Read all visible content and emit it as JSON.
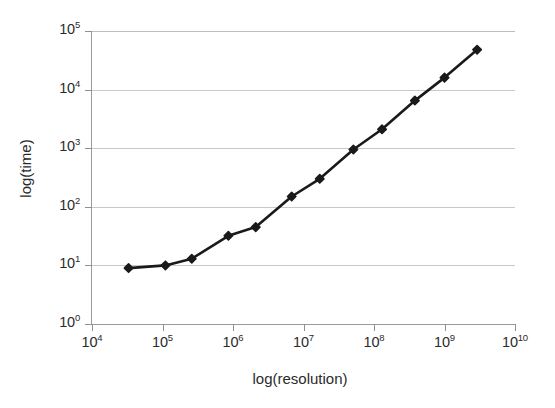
{
  "chart_data": {
    "type": "line",
    "title": "",
    "xlabel": "log(resolution)",
    "ylabel": "log(time)",
    "xscale": "log",
    "yscale": "log",
    "xlim": [
      10000,
      10000000000
    ],
    "ylim": [
      1,
      100000
    ],
    "grid": true,
    "grid_axis": "y",
    "legend": "none",
    "marker": "filled-diamond",
    "line_color": "#1a1a1a",
    "marker_color": "#1a1a1a",
    "grid_color": "#c9c9c9",
    "background": "#ffffff",
    "xtick_labels": [
      "10⁴",
      "10⁵",
      "10⁶",
      "10⁷",
      "10⁸",
      "10⁹",
      "10¹⁰"
    ],
    "xtick_values": [
      10000,
      100000,
      1000000,
      10000000,
      100000000,
      1000000000,
      10000000000
    ],
    "ytick_labels": [
      "10⁰",
      "10¹",
      "10²",
      "10³",
      "10⁴",
      "10⁵"
    ],
    "ytick_values": [
      1,
      10,
      100,
      1000,
      10000,
      100000
    ],
    "series": [
      {
        "name": "time vs resolution",
        "x": [
          33000,
          110000,
          260000,
          860000,
          2100000,
          6800000,
          17000000,
          51000000,
          130000000,
          380000000,
          1000000000,
          2900000000
        ],
        "y": [
          9,
          10,
          13,
          32,
          45,
          150,
          300,
          950,
          2100,
          6500,
          16000,
          48000
        ]
      }
    ]
  },
  "axes": {
    "x_title": "log(resolution)",
    "y_title": "log(time)",
    "x_ticks": [
      {
        "mantissa": "10",
        "exp": "4"
      },
      {
        "mantissa": "10",
        "exp": "5"
      },
      {
        "mantissa": "10",
        "exp": "6"
      },
      {
        "mantissa": "10",
        "exp": "7"
      },
      {
        "mantissa": "10",
        "exp": "8"
      },
      {
        "mantissa": "10",
        "exp": "9"
      },
      {
        "mantissa": "10",
        "exp": "10"
      }
    ],
    "y_ticks": [
      {
        "mantissa": "10",
        "exp": "5"
      },
      {
        "mantissa": "10",
        "exp": "4"
      },
      {
        "mantissa": "10",
        "exp": "3"
      },
      {
        "mantissa": "10",
        "exp": "2"
      },
      {
        "mantissa": "10",
        "exp": "1"
      },
      {
        "mantissa": "10",
        "exp": "0"
      }
    ]
  }
}
